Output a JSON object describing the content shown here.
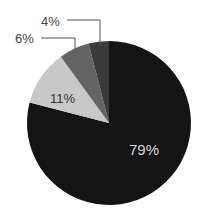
{
  "chart_data": {
    "type": "pie",
    "title": "",
    "start_angle_deg": 0,
    "direction": "clockwise",
    "slices": [
      {
        "label": "79%",
        "value": 79,
        "color": "#141414"
      },
      {
        "label": "11%",
        "value": 11,
        "color": "#c8c8c8"
      },
      {
        "label": "6%",
        "value": 6,
        "color": "#646464"
      },
      {
        "label": "4%",
        "value": 4,
        "color": "#3a3a3a"
      }
    ],
    "legend": "none",
    "label_positions": {
      "79%": "inside",
      "11%": "inside",
      "6%": "outside-leader",
      "4%": "outside-leader"
    }
  },
  "labels": {
    "s0": "79%",
    "s1": "11%",
    "s2": "6%",
    "s3": "4%"
  }
}
